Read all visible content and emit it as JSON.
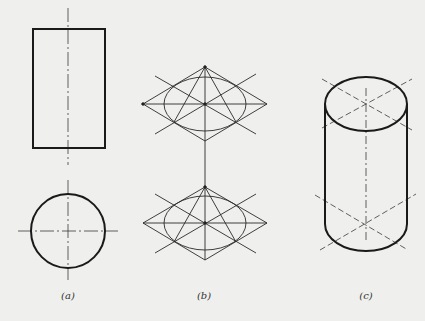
{
  "figure": {
    "panels": [
      {
        "id": "a",
        "label": "(a)",
        "description": "Orthographic views of a cylinder: front view rectangle and top view circle with center lines",
        "rect": {
          "x": 33,
          "y": 29,
          "w": 72,
          "h": 119
        },
        "circle": {
          "cx": 68,
          "cy": 231,
          "r": 37
        },
        "center_x": 68
      },
      {
        "id": "b",
        "label": "(b)",
        "description": "Four-center ellipse construction inside rhombi for top and bottom faces",
        "top_center": {
          "x": 205,
          "y": 104
        },
        "bottom_center": {
          "x": 205,
          "y": 223
        },
        "rhombus_half_w": 62,
        "rhombus_half_h": 37,
        "ellipse_rx": 41,
        "ellipse_ry": 27
      },
      {
        "id": "c",
        "label": "(c)",
        "description": "Completed isometric cylinder with elliptical ends and center lines",
        "top_center": {
          "x": 366,
          "y": 104
        },
        "bottom_center": {
          "x": 366,
          "y": 224
        },
        "ellipse_rx": 41,
        "ellipse_ry": 27
      }
    ]
  },
  "colors": {
    "background": "#efefed",
    "line": "#1a1a1a",
    "thin": "#3a3a3a"
  }
}
